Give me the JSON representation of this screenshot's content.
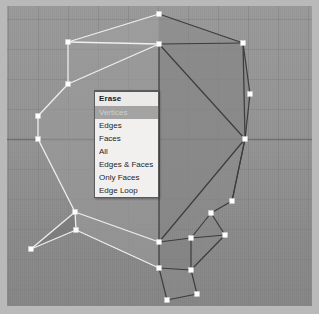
{
  "app": {
    "name": "3d-modeling-viewport",
    "canvas_width": 319,
    "canvas_height": 314
  },
  "viewport": {
    "name": "3d-viewport",
    "background_color": "#919191",
    "grid_color": "#7e7e7e",
    "grid_spacing": 30,
    "axis_line_color": "#6f6f6f",
    "vertex_color": "#ffffff",
    "selected_edge_color": "#f0f0f0",
    "unselected_edge_color": "#3a3a3a",
    "face_fill_light": "#9c9c9c",
    "face_fill_dark": "#7f7f7f"
  },
  "context_menu": {
    "name": "erase-context-menu",
    "title": "Erase",
    "background_color": "#f2f0ee",
    "border_color": "#5a5a5a",
    "highlight_color": "#a3a3a3",
    "highlighted_index": 0,
    "items": [
      {
        "label": "Vertices",
        "highlighted": true
      },
      {
        "label": "Edges",
        "highlighted": false
      },
      {
        "label": "Faces",
        "highlighted": false
      },
      {
        "label": "All",
        "highlighted": false
      },
      {
        "label": "Edges & Faces",
        "highlighted": false
      },
      {
        "label": "Only Faces",
        "highlighted": false
      },
      {
        "label": "Edge Loop",
        "highlighted": false
      }
    ]
  },
  "mesh": {
    "name": "head-profile-mesh",
    "description": "wireframe polygon mesh of a head silhouette in edit mode",
    "vertices": [
      {
        "x": 152,
        "y": 8
      },
      {
        "x": 152,
        "y": 38
      },
      {
        "x": 61,
        "y": 36
      },
      {
        "x": 61,
        "y": 78
      },
      {
        "x": 31,
        "y": 110
      },
      {
        "x": 31,
        "y": 133
      },
      {
        "x": 68,
        "y": 206
      },
      {
        "x": 24,
        "y": 243
      },
      {
        "x": 69,
        "y": 224
      },
      {
        "x": 236,
        "y": 37
      },
      {
        "x": 243,
        "y": 88
      },
      {
        "x": 238,
        "y": 133
      },
      {
        "x": 225,
        "y": 195
      },
      {
        "x": 152,
        "y": 236
      },
      {
        "x": 152,
        "y": 262
      },
      {
        "x": 184,
        "y": 232
      },
      {
        "x": 184,
        "y": 264
      },
      {
        "x": 204,
        "y": 207
      },
      {
        "x": 218,
        "y": 229
      },
      {
        "x": 160,
        "y": 294
      },
      {
        "x": 190,
        "y": 288
      }
    ]
  }
}
